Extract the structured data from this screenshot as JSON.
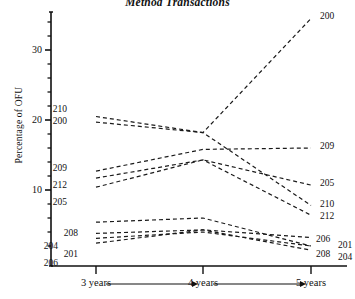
{
  "chart_data": {
    "type": "line",
    "title": "Method Transactions",
    "xlabel": "",
    "ylabel": "Percentage of OFU",
    "categories": [
      "3 years",
      "4 years",
      "5 years"
    ],
    "x": [
      3,
      4,
      5
    ],
    "ylim": [
      0,
      36
    ],
    "yticks": [
      10,
      20,
      30
    ],
    "ytick_labels": [
      "10",
      "20",
      "30"
    ],
    "minor_ticks": true,
    "grid": false,
    "legend": "inline-endpoint-labels",
    "line_style": "dashed",
    "line_color": "#1a1a1a",
    "series": [
      {
        "name": "200",
        "values": [
          19.7,
          18.2,
          34.5
        ]
      },
      {
        "name": "210",
        "values": [
          20.5,
          18.2,
          7.8
        ]
      },
      {
        "name": "209",
        "values": [
          12.7,
          15.8,
          16.0
        ]
      },
      {
        "name": "212",
        "values": [
          11.7,
          14.3,
          6.4
        ]
      },
      {
        "name": "205",
        "values": [
          10.4,
          14.3,
          10.7
        ]
      },
      {
        "name": "208",
        "values": [
          5.4,
          6.0,
          2.0
        ]
      },
      {
        "name": "204",
        "values": [
          3.8,
          4.3,
          1.4
        ]
      },
      {
        "name": "201",
        "values": [
          3.1,
          4.0,
          2.0
        ]
      },
      {
        "name": "206",
        "values": [
          2.4,
          4.3,
          3.2
        ]
      }
    ],
    "left_labels": [
      "210",
      "200",
      "209",
      "212",
      "205",
      "208",
      "204",
      "201",
      "206"
    ],
    "right_labels": [
      "200",
      "209",
      "205",
      "210",
      "212",
      "206",
      "201",
      "208",
      "204"
    ],
    "axis_arrows": [
      "3 years to 4 years",
      "4 years to 5 years"
    ]
  }
}
